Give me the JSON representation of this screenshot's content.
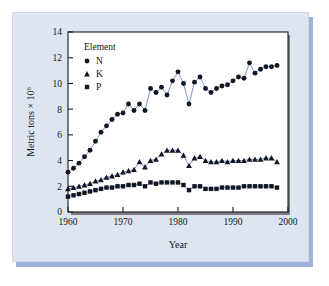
{
  "figure": {
    "panel_bg": "#dde5f0",
    "panel_shadow": "#9db3d8",
    "plot_bg": "#ffffff",
    "line_color": "#5b7bbf",
    "marker_color": "#111722"
  },
  "legend": {
    "title": "Element",
    "entries": [
      {
        "label": "N",
        "marker": "circle-marker-icon"
      },
      {
        "label": "K",
        "marker": "triangle-marker-icon"
      },
      {
        "label": "P",
        "marker": "square-marker-icon"
      }
    ]
  },
  "axes": {
    "x_title": "Year",
    "y_title_main": "Metric tons × 10",
    "y_title_exp": "6",
    "x_ticklabels": [
      "1960",
      "1970",
      "1980",
      "1990",
      "2000"
    ],
    "y_ticklabels": [
      "0",
      "2",
      "4",
      "6",
      "8",
      "10",
      "12",
      "14"
    ]
  },
  "chart_data": {
    "type": "line",
    "title": "",
    "xlabel": "Year",
    "ylabel": "Metric tons x 10^6",
    "xlim": [
      1960,
      2000
    ],
    "ylim": [
      0,
      14
    ],
    "xticks": [
      1960,
      1970,
      1980,
      1990,
      2000
    ],
    "yticks": [
      0,
      2,
      4,
      6,
      8,
      10,
      12,
      14
    ],
    "grid": false,
    "legend_position": "upper-left-inside",
    "legend_title": "Element",
    "x": [
      1960,
      1961,
      1962,
      1963,
      1964,
      1965,
      1966,
      1967,
      1968,
      1969,
      1970,
      1971,
      1972,
      1973,
      1974,
      1975,
      1976,
      1977,
      1978,
      1979,
      1980,
      1981,
      1982,
      1983,
      1984,
      1985,
      1986,
      1987,
      1988,
      1989,
      1990,
      1991,
      1992,
      1993,
      1994,
      1995,
      1996,
      1997,
      1998
    ],
    "series": [
      {
        "name": "N",
        "marker": "circle",
        "values": [
          3.1,
          3.4,
          3.8,
          4.3,
          4.8,
          5.5,
          6.2,
          6.7,
          7.2,
          7.6,
          7.7,
          8.4,
          7.9,
          8.4,
          7.9,
          9.6,
          9.3,
          9.7,
          9.1,
          10.2,
          10.9,
          10.0,
          8.4,
          10.1,
          10.5,
          9.6,
          9.3,
          9.6,
          9.8,
          9.9,
          10.2,
          10.5,
          10.4,
          11.6,
          10.8,
          11.1,
          11.3,
          11.3,
          11.4
        ]
      },
      {
        "name": "K",
        "marker": "triangle",
        "values": [
          1.8,
          1.9,
          2.0,
          2.1,
          2.2,
          2.4,
          2.5,
          2.7,
          2.8,
          2.9,
          3.1,
          3.2,
          3.3,
          3.9,
          3.5,
          4.0,
          4.1,
          4.5,
          4.8,
          4.8,
          4.8,
          4.4,
          3.6,
          4.2,
          4.3,
          4.0,
          3.9,
          3.9,
          4.0,
          3.9,
          4.0,
          4.0,
          4.0,
          4.1,
          4.1,
          4.1,
          4.2,
          4.2,
          3.9
        ]
      },
      {
        "name": "P",
        "marker": "square",
        "values": [
          1.2,
          1.3,
          1.4,
          1.5,
          1.6,
          1.7,
          1.8,
          1.9,
          1.9,
          2.0,
          2.0,
          2.1,
          2.1,
          2.2,
          2.0,
          2.3,
          2.2,
          2.3,
          2.3,
          2.3,
          2.3,
          2.1,
          1.7,
          2.0,
          2.0,
          1.8,
          1.8,
          1.8,
          1.9,
          1.9,
          1.9,
          1.9,
          2.0,
          2.0,
          2.0,
          2.0,
          2.0,
          2.0,
          1.9
        ]
      }
    ]
  }
}
